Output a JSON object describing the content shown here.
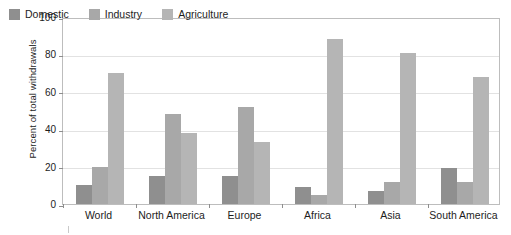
{
  "chart_data": {
    "type": "bar",
    "title": "",
    "subtitle": "",
    "xlabel": "",
    "ylabel": "Percent of total withdrawals",
    "categories": [
      "World",
      "North America",
      "Europe",
      "Africa",
      "Asia",
      "South America"
    ],
    "series": [
      {
        "name": "Domestic",
        "color": "#8f8f8f",
        "values": [
          10,
          15,
          15,
          9,
          7,
          19
        ]
      },
      {
        "name": "Industry",
        "color": "#a8a8a8",
        "values": [
          20,
          48,
          52,
          5,
          12,
          12
        ]
      },
      {
        "name": "Agriculture",
        "color": "#b5b5b5",
        "values": [
          70,
          38,
          33,
          88,
          81,
          68
        ]
      }
    ],
    "ylim": [
      0,
      100
    ],
    "yticks": [
      0,
      20,
      40,
      60,
      80,
      100
    ],
    "ytick_labels": [
      "0",
      "20",
      "40",
      "60",
      "80",
      "100"
    ],
    "grid": true,
    "grid_axis": "y",
    "legend_position": "top-left-inside",
    "axis_color": "#bdbdbd",
    "grid_color": "#e2e2e2",
    "background_color": "#ffffff",
    "text_color": "#1d1d1d"
  },
  "legend": {
    "items": [
      {
        "label": "Domestic"
      },
      {
        "label": "Industry"
      },
      {
        "label": "Agriculture"
      }
    ]
  }
}
